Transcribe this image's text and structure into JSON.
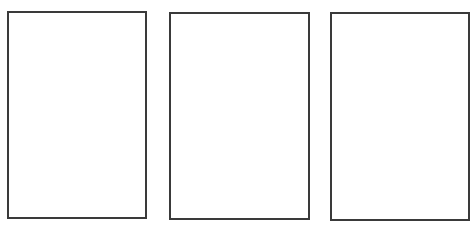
{
  "canvas": {
    "width": 473,
    "height": 235,
    "background": "#ffffff"
  },
  "style": {
    "border_color": "#3a3a3a",
    "border_width": 2,
    "fill": "#ffffff"
  },
  "panels": [
    {
      "id": "panel-1",
      "left": 7,
      "top": 11,
      "width": 140,
      "height": 208,
      "content": ""
    },
    {
      "id": "panel-2",
      "left": 169,
      "top": 12,
      "width": 141,
      "height": 208,
      "content": ""
    },
    {
      "id": "panel-3",
      "left": 330,
      "top": 12,
      "width": 140,
      "height": 209,
      "content": ""
    }
  ]
}
